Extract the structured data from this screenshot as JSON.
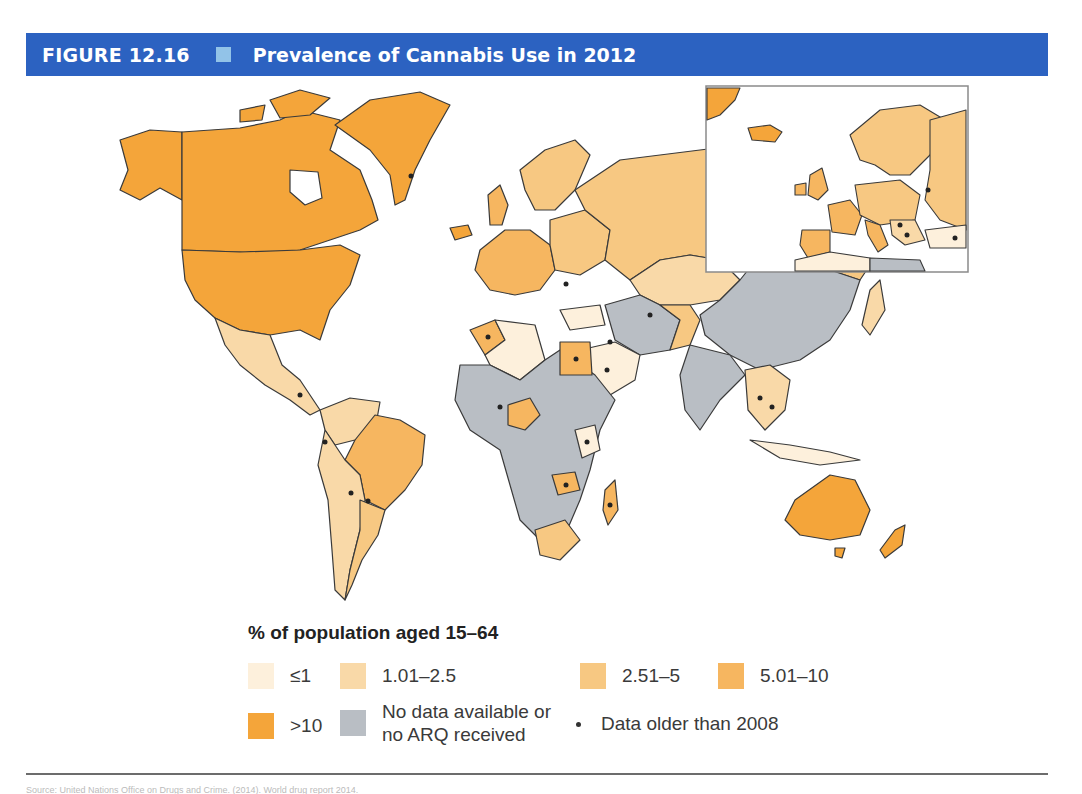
{
  "header": {
    "figure_number": "FIGURE 12.16",
    "title": "Prevalence of Cannabis Use in 2012",
    "bar_color": "#2c62c1",
    "square_color": "#92c3e8"
  },
  "legend": {
    "title": "% of population aged 15–64",
    "items": [
      {
        "label": "≤1",
        "color": "#fdf0dc"
      },
      {
        "label": "1.01–2.5",
        "color": "#f9d9a8"
      },
      {
        "label": "2.51–5",
        "color": "#f7c882"
      },
      {
        "label": "5.01–10",
        "color": "#f6b660"
      },
      {
        "label": ">10",
        "color": "#f4a53a"
      },
      {
        "label_line1": "No data available or",
        "label_line2": "no ARQ received",
        "color": "#b9bec4"
      },
      {
        "label": "Data older than 2008",
        "marker": "dot"
      }
    ]
  },
  "map": {
    "type": "choropleth",
    "subject": "World map of cannabis prevalence",
    "inset": "Europe",
    "regions": [
      {
        "name": "North America (USA, Canada, Greenland, Alaska)",
        "category": ">10"
      },
      {
        "name": "Mexico",
        "category": "1.01–2.5"
      },
      {
        "name": "Brazil",
        "category": "5.01–10"
      },
      {
        "name": "South America (rest)",
        "category": "2.51–5"
      },
      {
        "name": "Russia",
        "category": "2.51–5"
      },
      {
        "name": "Western Europe",
        "category": "5.01–10"
      },
      {
        "name": "Kazakhstan",
        "category": "1.01–2.5"
      },
      {
        "name": "China / Mongolia",
        "category": "No data"
      },
      {
        "name": "India",
        "category": "No data"
      },
      {
        "name": "Middle East (Saudi Arabia)",
        "category": "≤1"
      },
      {
        "name": "Egypt",
        "category": "5.01–10"
      },
      {
        "name": "Algeria",
        "category": "≤1"
      },
      {
        "name": "Central Africa",
        "category": "No data"
      },
      {
        "name": "Nigeria",
        "category": "5.01–10"
      },
      {
        "name": "Zambia",
        "category": "5.01–10"
      },
      {
        "name": "Madagascar",
        "category": "5.01–10"
      },
      {
        "name": "South Africa",
        "category": "2.51–5"
      },
      {
        "name": "Southeast Asia",
        "category": "1.01–2.5"
      },
      {
        "name": "Australia",
        "category": ">10"
      },
      {
        "name": "New Zealand",
        "category": ">10"
      }
    ]
  },
  "footer": {
    "source_text": "Source: United Nations Office on Drugs and Crime. (2014). World drug report 2014."
  }
}
